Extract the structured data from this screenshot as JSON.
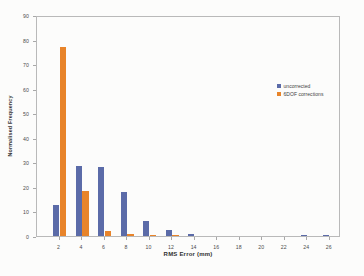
{
  "chart_data": {
    "type": "bar",
    "title": "",
    "subtitle": "",
    "xlabel": "RMS Error (mm)",
    "ylabel": "Normalised Frequency",
    "xlim": [
      0,
      27
    ],
    "ylim": [
      0,
      90
    ],
    "ytick_step": 10,
    "grid": false,
    "legend_position": "upper right (inside plot area)",
    "categories": [
      2,
      4,
      6,
      8,
      10,
      12,
      14,
      16,
      18,
      20,
      22,
      24,
      26
    ],
    "xtick_labels": [
      "2",
      "4",
      "6",
      "8",
      "10",
      "12",
      "14",
      "16",
      "18",
      "20",
      "22",
      "24",
      "26"
    ],
    "ytick_labels": [
      "0",
      "10",
      "20",
      "30",
      "40",
      "50",
      "60",
      "70",
      "80",
      "90"
    ],
    "series": [
      {
        "name": "uncorrected",
        "color": "#5b6ba8",
        "values": [
          12.5,
          28.5,
          28,
          18,
          6,
          2.3,
          0.8,
          0,
          0,
          0,
          0,
          0.4,
          0.3
        ]
      },
      {
        "name": "6DOF corrections",
        "color": "#e8842a",
        "values": [
          77,
          18.5,
          2.2,
          1.0,
          0.4,
          0.2,
          0,
          0,
          0,
          0,
          0,
          0,
          0
        ]
      }
    ],
    "annotations": []
  },
  "legend": {
    "items": [
      {
        "label": "uncorrected",
        "color": "#5b6ba8"
      },
      {
        "label": "6DOF corrections",
        "color": "#e8842a"
      }
    ]
  },
  "axes": {
    "x_title": "RMS Error (mm)",
    "y_title": "Normalised Frequency"
  }
}
